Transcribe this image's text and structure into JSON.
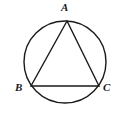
{
  "figure": {
    "background_color": "#ffffff",
    "stroke_color": "#1a1a1a",
    "label_color": "#1a1a1a",
    "width": 120,
    "height": 118
  },
  "labels": {
    "a": "A",
    "b": "B",
    "c": "C"
  },
  "chart_data": {
    "type": "diagram",
    "shapes": [
      {
        "name": "circumscribed-circle",
        "kind": "circle",
        "cx": 65,
        "cy": 62,
        "r": 41,
        "stroke": "#1a1a1a",
        "stroke_width": 1.4,
        "fill": "none"
      },
      {
        "name": "inscribed-triangle",
        "kind": "polygon",
        "points": [
          [
            67,
            21
          ],
          [
            31,
            86
          ],
          [
            99,
            86
          ]
        ],
        "stroke": "#1a1a1a",
        "stroke_width": 1.4,
        "fill": "none"
      }
    ],
    "points": [
      {
        "label": "A",
        "x": 67,
        "y": 21,
        "label_position": "above"
      },
      {
        "label": "B",
        "x": 31,
        "y": 86,
        "label_position": "left"
      },
      {
        "label": "C",
        "x": 99,
        "y": 86,
        "label_position": "right"
      }
    ]
  }
}
